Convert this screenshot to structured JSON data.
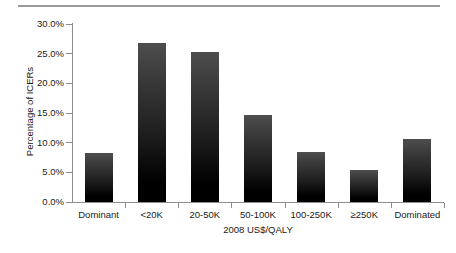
{
  "chart_data": {
    "type": "bar",
    "title": "",
    "subtitle": "",
    "xlabel": "2008 US$/QALY",
    "ylabel": "Percentage of ICERs",
    "categories": [
      "Dominant",
      "<20K",
      "20-50K",
      "50-100K",
      "100-250K",
      "≥250K",
      "Dominated"
    ],
    "values": [
      8.2,
      26.8,
      25.2,
      14.7,
      8.4,
      5.4,
      10.7
    ],
    "ylim": [
      0,
      30
    ],
    "ytick_values": [
      0,
      5,
      10,
      15,
      20,
      25,
      30
    ],
    "ytick_labels": [
      "0.0%",
      "5.0%",
      "10.0%",
      "15.0%",
      "20.0%",
      "25.0%",
      "30.0%"
    ],
    "grid": false,
    "legend": null,
    "bar_color_top": "#4e4e4e",
    "bar_color_bottom": "#000000",
    "axis_color": "#8c8c8c",
    "background_color": "#ffffff"
  },
  "figure": {
    "top_rule_color": "#9a9a9a"
  }
}
